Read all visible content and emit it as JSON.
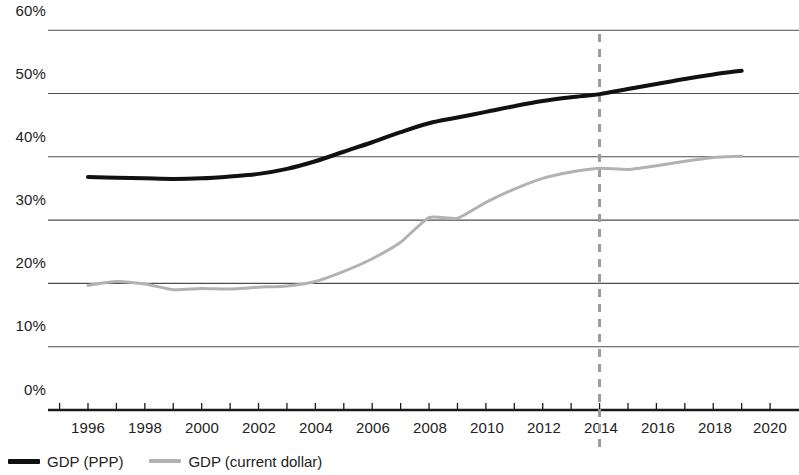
{
  "chart_data": {
    "type": "line",
    "title": "",
    "subtitle": "",
    "xlabel": "",
    "ylabel": "",
    "xlim": [
      1995,
      2020
    ],
    "ylim": [
      0,
      60
    ],
    "y_unit": "%",
    "grid": true,
    "legend_position": "bottom-left",
    "y_tick_labels": [
      "60%",
      "50%",
      "40%",
      "30%",
      "20%",
      "10%",
      "0%"
    ],
    "y_tick_values": [
      60,
      50,
      40,
      30,
      20,
      10,
      0
    ],
    "x_tick_labels": [
      "1996",
      "1998",
      "2000",
      "2002",
      "2004",
      "2006",
      "2008",
      "2010",
      "2012",
      "2014",
      "2016",
      "2018",
      "2020"
    ],
    "x_tick_values": [
      1996,
      1998,
      2000,
      2002,
      2004,
      2006,
      2008,
      2010,
      2012,
      2014,
      2016,
      2018,
      2020
    ],
    "x": [
      1996,
      1997,
      1998,
      1999,
      2000,
      2001,
      2002,
      2003,
      2004,
      2005,
      2006,
      2007,
      2008,
      2009,
      2010,
      2011,
      2012,
      2013,
      2014,
      2015,
      2016,
      2017,
      2018,
      2019
    ],
    "series": [
      {
        "name": "GDP (PPP)",
        "color": "#111111",
        "width": 4,
        "values": [
          36.8,
          36.7,
          36.6,
          36.5,
          36.6,
          36.9,
          37.3,
          38.1,
          39.3,
          40.8,
          42.3,
          43.9,
          45.3,
          46.2,
          47.1,
          48.0,
          48.8,
          49.4,
          49.9,
          50.7,
          51.5,
          52.3,
          53.0,
          53.6
        ]
      },
      {
        "name": "GDP (current dollar)",
        "color": "#b2b2b2",
        "width": 3,
        "values": [
          19.7,
          20.3,
          19.9,
          19.0,
          19.2,
          19.1,
          19.4,
          19.6,
          20.3,
          21.9,
          23.9,
          26.5,
          30.4,
          30.3,
          32.8,
          34.9,
          36.6,
          37.6,
          38.2,
          38.0,
          38.6,
          39.3,
          39.9,
          40.1
        ]
      }
    ],
    "annotations": [
      {
        "type": "vertical-dashed-line",
        "x": 2014,
        "color": "#9b9b9b",
        "dash": "8 7",
        "width": 3
      }
    ]
  },
  "legend": {
    "items": [
      {
        "label": "GDP (PPP)",
        "marker": "thick-dark-line"
      },
      {
        "label": "GDP (current dollar)",
        "marker": "thin-gray-line"
      }
    ]
  },
  "colors": {
    "ppp_line": "#111111",
    "current_dollar_line": "#b2b2b2",
    "gridline": "#4d4d4d",
    "axis": "#1a1a1a",
    "marker_line": "#9b9b9b",
    "text": "#222222",
    "background": "#ffffff"
  }
}
